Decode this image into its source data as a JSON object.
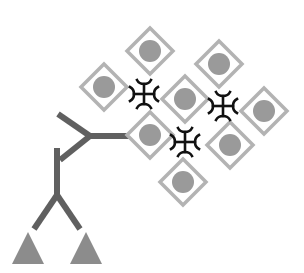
{
  "diagram": {
    "title": "",
    "colors": {
      "background": "#ffffff",
      "diamond_stroke": "#b3b3b3",
      "diamond_fill": "#ffffff",
      "circle_fill": "#9a9a9a",
      "crosslinker": "#111111",
      "receptor": "#606060",
      "triangle": "#8c8c8c"
    },
    "diamonds": [
      {
        "cx": 150,
        "cy": 51
      },
      {
        "cx": 219,
        "cy": 64
      },
      {
        "cx": 104,
        "cy": 87
      },
      {
        "cx": 185,
        "cy": 99
      },
      {
        "cx": 264,
        "cy": 111
      },
      {
        "cx": 150,
        "cy": 135
      },
      {
        "cx": 230,
        "cy": 145
      },
      {
        "cx": 183,
        "cy": 182
      }
    ],
    "diamond_half_diagonal": 23,
    "circle_radius": 11,
    "crosslinkers": [
      {
        "cx": 144,
        "cy": 94
      },
      {
        "cx": 223,
        "cy": 106
      },
      {
        "cx": 185,
        "cy": 142
      }
    ],
    "receptor": {
      "segments": [
        {
          "x1": 58,
          "y1": 114,
          "x2": 90,
          "y2": 136
        },
        {
          "x1": 60,
          "y1": 160,
          "x2": 90,
          "y2": 136
        },
        {
          "x1": 90,
          "y1": 136,
          "x2": 132,
          "y2": 136
        },
        {
          "x1": 57,
          "y1": 148,
          "x2": 57,
          "y2": 195
        },
        {
          "x1": 57,
          "y1": 195,
          "x2": 34,
          "y2": 229
        },
        {
          "x1": 57,
          "y1": 195,
          "x2": 80,
          "y2": 229
        }
      ]
    },
    "triangles": [
      {
        "apex_x": 28,
        "apex_y": 232,
        "base_y": 264,
        "half_width": 16
      },
      {
        "apex_x": 86,
        "apex_y": 232,
        "base_y": 264,
        "half_width": 16
      }
    ]
  }
}
